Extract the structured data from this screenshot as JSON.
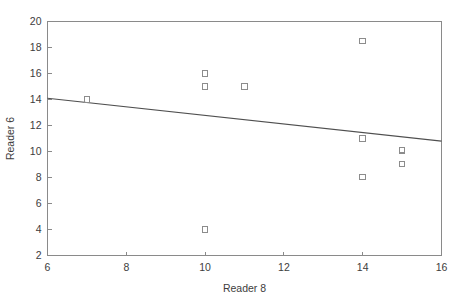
{
  "chart_data": {
    "type": "scatter",
    "title": "",
    "xlabel": "Reader 8",
    "ylabel": "Reader 6",
    "xlim": [
      6,
      16
    ],
    "ylim": [
      2,
      20
    ],
    "xticks": [
      6,
      8,
      10,
      12,
      14,
      16
    ],
    "yticks": [
      2,
      4,
      6,
      8,
      10,
      12,
      14,
      16,
      18,
      20
    ],
    "grid": false,
    "legend": null,
    "marker_style": "open-square",
    "points": [
      {
        "x": 7,
        "y": 14.0
      },
      {
        "x": 10,
        "y": 16.0
      },
      {
        "x": 10,
        "y": 15.0
      },
      {
        "x": 10,
        "y": 4.0
      },
      {
        "x": 11,
        "y": 15.0
      },
      {
        "x": 14,
        "y": 18.5
      },
      {
        "x": 14,
        "y": 11.0
      },
      {
        "x": 14,
        "y": 8.05
      },
      {
        "x": 15,
        "y": 10.1
      },
      {
        "x": 15,
        "y": 9.05
      }
    ],
    "series": [
      {
        "name": "Reader 6 vs Reader 8",
        "x": [
          7,
          10,
          10,
          10,
          11,
          14,
          14,
          14,
          15,
          15
        ],
        "values": [
          14.0,
          16.0,
          15.0,
          4.0,
          15.0,
          18.5,
          11.0,
          8.05,
          10.1,
          9.05
        ]
      }
    ],
    "fit_line": {
      "type": "line",
      "x": [
        6,
        16
      ],
      "y": [
        14.1,
        10.8
      ]
    },
    "colors": {
      "marker_stroke": "#8c8c8c",
      "fit_line": "#4f4f4f",
      "axis": "#8a8a8a",
      "text": "#3d3d3d",
      "background": "#ffffff"
    }
  },
  "axis": {
    "x_title": "Reader 8",
    "y_title": "Reader 6",
    "x_tick_labels": [
      "6",
      "8",
      "10",
      "12",
      "14",
      "16"
    ],
    "y_tick_labels": [
      "2",
      "4",
      "6",
      "8",
      "10",
      "12",
      "14",
      "16",
      "18",
      "20"
    ]
  }
}
